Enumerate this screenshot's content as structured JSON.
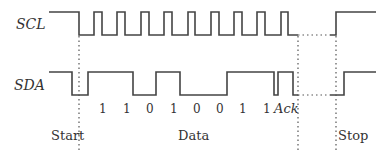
{
  "diagram": {
    "signals": {
      "scl": {
        "label": "SCL"
      },
      "sda": {
        "label": "SDA"
      }
    },
    "bits": [
      "1",
      "1",
      "0",
      "1",
      "0",
      "0",
      "1",
      "1"
    ],
    "ack_label": "Ack",
    "phases": {
      "start": "Start",
      "data": "Data",
      "stop": "Stop"
    },
    "colors": {
      "line": "#444444",
      "text": "#333333",
      "background": "#ffffff"
    }
  }
}
